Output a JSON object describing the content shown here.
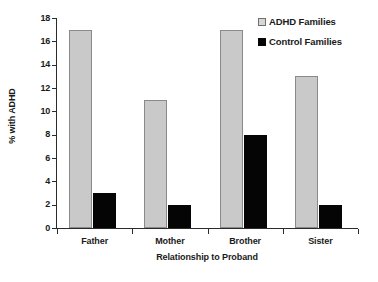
{
  "chart_data": {
    "type": "bar",
    "title": "",
    "subtitle": "",
    "xlabel": "Relationship to Proband",
    "ylabel": "% with ADHD",
    "categories": [
      "Father",
      "Mother",
      "Brother",
      "Sister"
    ],
    "series": [
      {
        "name": "ADHD Families",
        "values": [
          17,
          11,
          17,
          13
        ],
        "color": "#c9c9c9"
      },
      {
        "name": "Control Families",
        "values": [
          3,
          2,
          8,
          2
        ],
        "color": "#050505"
      }
    ],
    "ylim": [
      0,
      18
    ],
    "ytick_labels": [
      "0",
      "2",
      "4",
      "6",
      "8",
      "10",
      "12",
      "14",
      "16",
      "18"
    ],
    "ytick_values": [
      0,
      2,
      4,
      6,
      8,
      10,
      12,
      14,
      16,
      18
    ],
    "grid": false,
    "legend_position": "top-right",
    "annotations": []
  }
}
